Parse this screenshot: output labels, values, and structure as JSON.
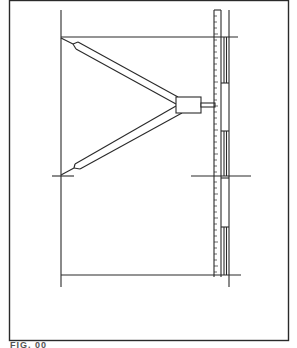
{
  "figure": {
    "type": "technical line drawing",
    "caption": "FIG. 00",
    "caption_note": "caption partially cut off at bottom edge",
    "colors": {
      "line": "#2a2a2a",
      "background": "#ffffff"
    }
  },
  "elements": {
    "frame": {
      "x": 9,
      "y": 0,
      "w": 280,
      "h": 341
    },
    "left_post": {
      "x": 61,
      "y1": 10,
      "y2": 287
    },
    "top_line": {
      "y": 37,
      "x1": 61,
      "x2": 238
    },
    "bottom_line": {
      "y": 275,
      "x1": 61,
      "x2": 241
    },
    "mid_left_cross": {
      "y": 176,
      "x1": 52,
      "x2": 74
    },
    "mid_right_cross": {
      "y": 176,
      "x1": 191,
      "x2": 251
    },
    "scale": {
      "x": 214,
      "y1": 10,
      "y2": 277,
      "width": 7
    },
    "slider_block": {
      "x": 176,
      "y": 97,
      "w": 25,
      "h": 16
    },
    "upper_arm": {
      "from": [
        61,
        37
      ],
      "to": [
        176,
        99
      ]
    },
    "lower_arm": {
      "from": [
        61,
        176
      ],
      "to": [
        176,
        111
      ]
    }
  }
}
